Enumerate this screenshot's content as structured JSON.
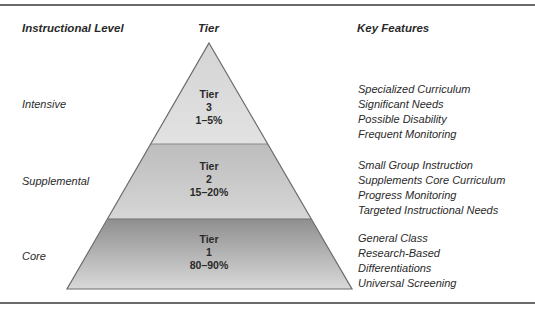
{
  "headers": {
    "level": "Instructional Level",
    "tier": "Tier",
    "features": "Key Features"
  },
  "tiers": [
    {
      "level": "Intensive",
      "label": "Tier",
      "number": "3",
      "percent": "1–5%",
      "fill": "#d9d9d9",
      "features": [
        "Specialized Curriculum",
        "Significant Needs",
        "Possible Disability",
        "Frequent Monitoring"
      ]
    },
    {
      "level": "Supplemental",
      "label": "Tier",
      "number": "2",
      "percent": "15–20%",
      "fill": "#c4c4c4",
      "features": [
        "Small Group Instruction",
        "Supplements Core Curriculum",
        "Progress Monitoring",
        "Targeted Instructional Needs"
      ]
    },
    {
      "level": "Core",
      "label": "Tier",
      "number": "1",
      "percent": "80–90%",
      "fill": "#a9a9a9",
      "features": [
        "General Class",
        "Research-Based",
        "Differentiations",
        "Universal Screening"
      ]
    }
  ]
}
